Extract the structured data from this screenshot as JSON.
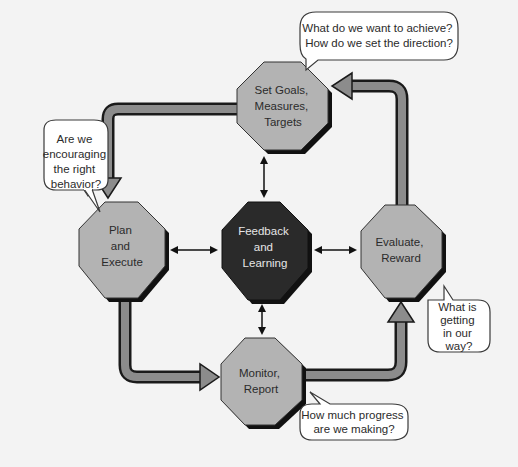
{
  "diagram": {
    "colors": {
      "background": "#f3f3f3",
      "node_fill": "#b3b3b3",
      "node_shadow": "#111111",
      "center_fill": "#2a2a2a",
      "flow_arrow_fill": "#8c8c8c",
      "flow_arrow_outline": "#1a1a1a",
      "bubble_fill": "#ffffff",
      "bubble_stroke": "#3a3a3a"
    },
    "nodes": {
      "top": {
        "lines": [
          "Set Goals,",
          "Measures,",
          "Targets"
        ]
      },
      "left": {
        "lines": [
          "Plan",
          "and",
          "Execute"
        ]
      },
      "center": {
        "lines": [
          "Feedback",
          "and",
          "Learning"
        ]
      },
      "right": {
        "lines": [
          "Evaluate,",
          "Reward"
        ]
      },
      "bottom": {
        "lines": [
          "Monitor,",
          "Report"
        ]
      }
    },
    "bubbles": {
      "top": {
        "lines": [
          "What do we want to achieve?",
          "How do we set the direction?"
        ]
      },
      "left": {
        "lines": [
          "Are we",
          "encouraging",
          "the right",
          "behavior?"
        ]
      },
      "right": {
        "lines": [
          "What is",
          "getting",
          "in our",
          "way?"
        ]
      },
      "bottom": {
        "lines": [
          "How much progress",
          "are we making?"
        ]
      }
    }
  }
}
